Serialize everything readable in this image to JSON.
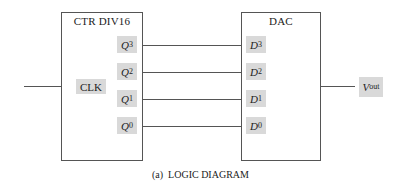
{
  "diagram": {
    "type": "logic-diagram",
    "caption": "(a)  LOGIC DIAGRAM",
    "counter": {
      "title": "CTR DIV16",
      "clock_label": "CLK",
      "outputs": [
        {
          "name": "Q",
          "sub": "3"
        },
        {
          "name": "Q",
          "sub": "2"
        },
        {
          "name": "Q",
          "sub": "1"
        },
        {
          "name": "Q",
          "sub": "0"
        }
      ]
    },
    "dac": {
      "title": "DAC",
      "inputs": [
        {
          "name": "D",
          "sub": "3"
        },
        {
          "name": "D",
          "sub": "2"
        },
        {
          "name": "D",
          "sub": "1"
        },
        {
          "name": "D",
          "sub": "0"
        }
      ]
    },
    "output": {
      "name": "V",
      "sub": "out"
    },
    "connections": [
      {
        "from": "Q3",
        "to": "D3"
      },
      {
        "from": "Q2",
        "to": "D2"
      },
      {
        "from": "Q1",
        "to": "D1"
      },
      {
        "from": "Q0",
        "to": "D0"
      },
      {
        "from": "DAC",
        "to": "Vout"
      },
      {
        "from": "clock-input",
        "to": "CLK"
      }
    ],
    "colors": {
      "line": "#555555",
      "pin_fill": "#d9d9d9",
      "background": "#ffffff"
    }
  }
}
